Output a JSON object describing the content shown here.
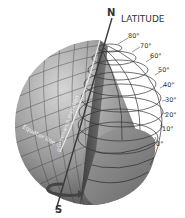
{
  "diagram": {
    "title": "LATITUDE",
    "north_label": "N",
    "south_label": "S",
    "equator_label": "Equator line",
    "meridian_label": "Greenwich meridian",
    "meridian_zero": "0",
    "latitude_ticks": [
      "80°",
      "70°",
      "60°",
      "50°",
      "40°",
      "30°",
      "20°",
      "10°",
      "0°"
    ],
    "colors": {
      "background": "#ffffff",
      "globe_light": "#c8c8c8",
      "globe_dark": "#5a5a5a",
      "cutaway": "#8a8a8a",
      "grid": "#333333",
      "axis": "#3a3a3a",
      "text": "#333333"
    }
  }
}
